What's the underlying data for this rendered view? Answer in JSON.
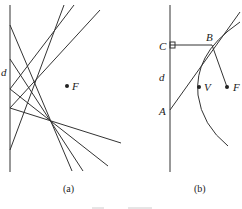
{
  "figure": {
    "panel_a": {
      "caption": "(a)",
      "labels": {
        "directrix": "d",
        "focus": "F"
      }
    },
    "panel_b": {
      "caption": "(b)",
      "labels": {
        "point_c": "C",
        "point_b": "B",
        "directrix": "d",
        "point_a": "A",
        "vertex": "V",
        "focus": "F"
      }
    }
  },
  "colors": {
    "ink": "#333333",
    "background": "#ffffff"
  }
}
